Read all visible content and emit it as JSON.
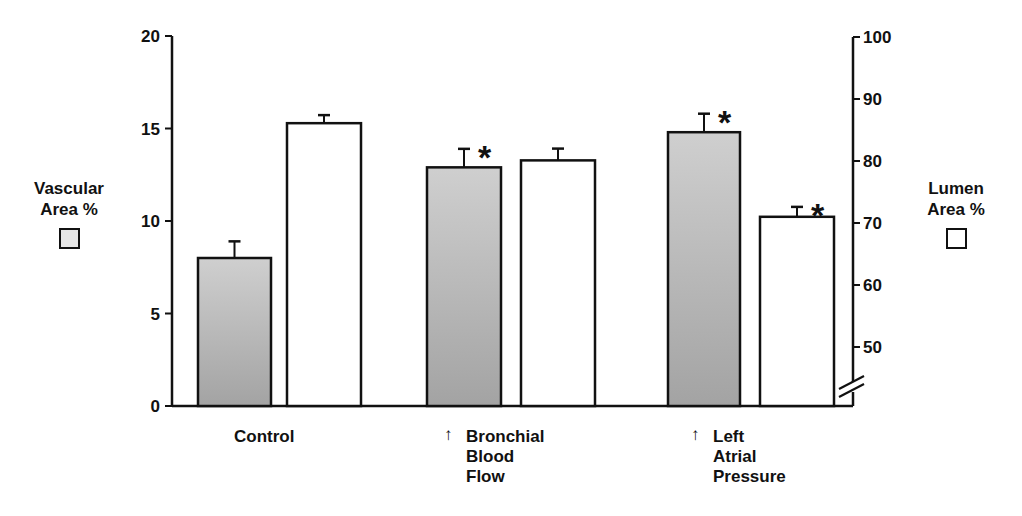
{
  "chart_data": {
    "type": "bar",
    "title": "",
    "categories": [
      "Control",
      "↑ Bronchial Blood Flow",
      "↑ Left Atrial Pressure"
    ],
    "category_label_lines": [
      [
        "Control"
      ],
      [
        "Bronchial",
        "Blood",
        "Flow"
      ],
      [
        "Left",
        "Atrial",
        "Pressure"
      ]
    ],
    "category_arrows": [
      false,
      true,
      true
    ],
    "series": [
      {
        "name": "Vascular Area %",
        "axis": "left",
        "fill": "shaded gray",
        "values": [
          8.0,
          12.9,
          14.8
        ],
        "error_upper": [
          8.9,
          13.9,
          15.8
        ],
        "significant": [
          false,
          true,
          true
        ]
      },
      {
        "name": "Lumen Area %",
        "axis": "right",
        "fill": "white",
        "values": [
          86.1,
          80.1,
          71.0
        ],
        "error_upper": [
          87.4,
          82.0,
          72.6
        ],
        "significant": [
          false,
          false,
          true
        ]
      }
    ],
    "left_axis": {
      "label": "Vascular Area %",
      "ylim": [
        0,
        20
      ],
      "ticks": [
        0,
        5,
        10,
        15,
        20
      ]
    },
    "right_axis": {
      "label": "Lumen Area %",
      "ylim": [
        45,
        100
      ],
      "ticks": [
        50,
        60,
        70,
        80,
        90,
        100
      ],
      "axis_break": true
    },
    "significance_marker": "*",
    "grid": false,
    "legend_position": "beside axes"
  },
  "labels": {
    "left_title_line1": "Vascular",
    "left_title_line2": "Area %",
    "right_title_line1": "Lumen",
    "right_title_line2": "Area %",
    "arrow_symbol": "↑",
    "cat0_line0": "Control",
    "cat1_line0": "Bronchial",
    "cat1_line1": "Blood",
    "cat1_line2": "Flow",
    "cat2_line0": "Left",
    "cat2_line1": "Atrial",
    "cat2_line2": "Pressure"
  },
  "colors": {
    "shaded_bar": "#b8b8b8",
    "shaded_bar_dark": "#9a9a9a",
    "white_bar": "#ffffff",
    "ink": "#111111"
  }
}
